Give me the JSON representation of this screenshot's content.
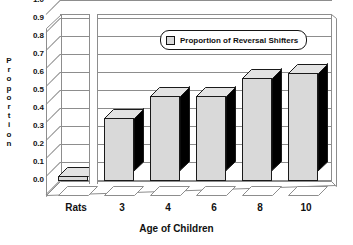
{
  "chart_data": {
    "type": "bar",
    "title": "",
    "xlabel": "Age of Children",
    "ylabel": "Proportion",
    "categories": [
      "Rats",
      "3",
      "4",
      "6",
      "8",
      "10"
    ],
    "values": [
      0.03,
      0.35,
      0.47,
      0.47,
      0.57,
      0.6
    ],
    "series": [
      {
        "name": "Proportion of Reversal Shifters",
        "values": [
          0.03,
          0.35,
          0.47,
          0.47,
          0.57,
          0.6
        ]
      }
    ],
    "ylim": [
      0.0,
      1.0
    ],
    "ytick_labels": [
      "1.0",
      "0.9",
      "0.8",
      "0.7",
      "0.6",
      "0.5",
      "0.4",
      "0.3",
      "0.2",
      "0.1",
      "0.0"
    ],
    "ytick_values": [
      1.0,
      0.9,
      0.8,
      0.7,
      0.6,
      0.5,
      0.4,
      0.3,
      0.2,
      0.1,
      0.0
    ],
    "grid": true,
    "legend": {
      "position": "inside-top-right",
      "entries": [
        "Proportion of Reversal Shifters"
      ]
    },
    "style": {
      "three_d": true,
      "bar_face_color": "#d9d9d9",
      "bar_side_color": "#000000",
      "bar_outline_color": "#1a1a1a",
      "grid_color": "#8d8d8d",
      "background": "#ffffff",
      "axis_break_after": "Rats"
    }
  },
  "axis": {
    "y_title_letters": [
      "P",
      "r",
      "o",
      "p",
      "o",
      "r",
      "t",
      "i",
      "o",
      "n"
    ],
    "y_title": "Proportion",
    "x_title": "Age of Children"
  },
  "legend": {
    "label": "Proportion of Reversal Shifters",
    "swatch_color": "#d9d9d9"
  }
}
